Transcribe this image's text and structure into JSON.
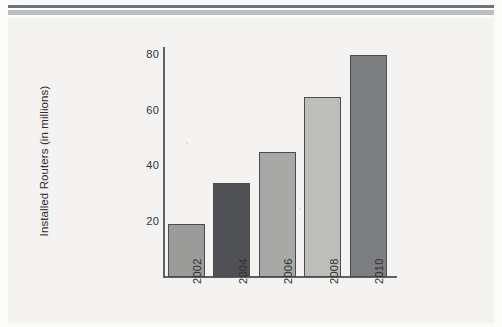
{
  "page": {
    "background_color": "#fbfbfa",
    "figure_background_color": "#f4f3f1",
    "rule_dark_color": "#6f7276",
    "rule_light_color": "#b9bcc0"
  },
  "chart_data": {
    "type": "bar",
    "title": "",
    "subtitle": "",
    "xlabel": "",
    "ylabel": "Installed Routers (in millions)",
    "categories": [
      "2002",
      "2004",
      "2006",
      "2008",
      "2010"
    ],
    "values": [
      19,
      34,
      45,
      65,
      80
    ],
    "ylim": [
      0,
      86
    ],
    "yticks": [
      20,
      40,
      60,
      80
    ],
    "ytick_labels": [
      "20",
      "40",
      "60",
      "80"
    ],
    "grid": false,
    "legend": null,
    "legend_position": "none",
    "xtick_rotation": 90,
    "ylabel_rotation": 90,
    "bar_colors": [
      "#9b9b9a",
      "#4f5154",
      "#a8a8a6",
      "#bdbdba",
      "#7c7e80"
    ],
    "bar_edge_color": "#4a4d50",
    "axis_color": "#5d6064",
    "tick_label_color": "#2f3133"
  }
}
